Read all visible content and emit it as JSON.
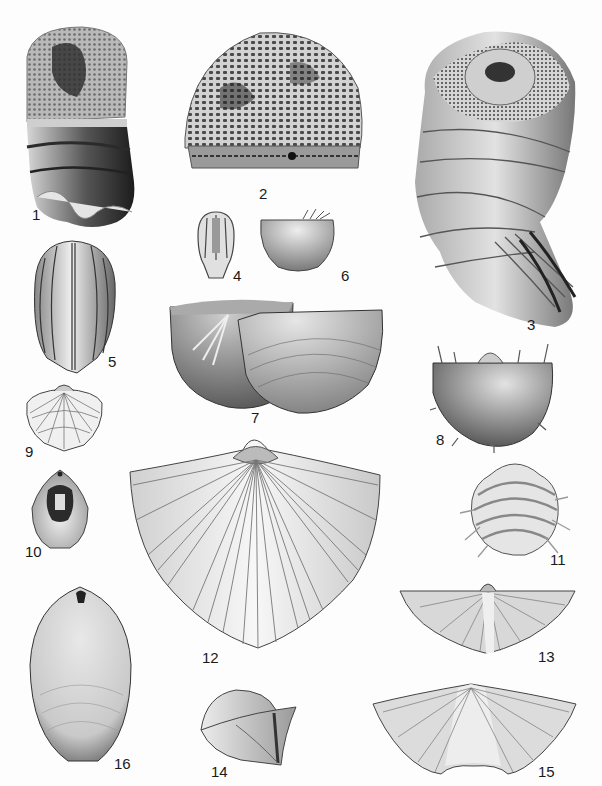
{
  "plate": {
    "background": "#fdfdfd",
    "ink": "#1a1a1a",
    "figures": [
      {
        "number": "1",
        "subject": "cylindrical coral/sponge fragment with pitted top and banded dark base"
      },
      {
        "number": "2",
        "subject": "dome-shaped honeycomb-textured colony (bryozoan/coral)"
      },
      {
        "number": "3",
        "subject": "coiled tubular shell with reticulated aperture"
      },
      {
        "number": "4",
        "subject": "small ribbed ovoid (blastoid calyx)"
      },
      {
        "number": "5",
        "subject": "ovoid blastoid with longitudinal ambulacra"
      },
      {
        "number": "6",
        "subject": "small round brachiopod with spines on hinge"
      },
      {
        "number": "7",
        "subject": "pair of semicircular brachiopod valves"
      },
      {
        "number": "8",
        "subject": "spiny productid brachiopod"
      },
      {
        "number": "9",
        "subject": "small radially ribbed brachiopod"
      },
      {
        "number": "10",
        "subject": "brachiopod interior with dark muscle scar"
      },
      {
        "number": "11",
        "subject": "concentrically banded spiny brachiopod"
      },
      {
        "number": "12",
        "subject": "large radially ribbed spiriferid brachiopod"
      },
      {
        "number": "13",
        "subject": "wide-hinged spiriferid brachiopod (dorsal view)"
      },
      {
        "number": "14",
        "subject": "brachiopod in lateral view"
      },
      {
        "number": "15",
        "subject": "wide-hinged spiriferid with central sulcus"
      },
      {
        "number": "16",
        "subject": "elongate smooth oval shell"
      }
    ]
  }
}
